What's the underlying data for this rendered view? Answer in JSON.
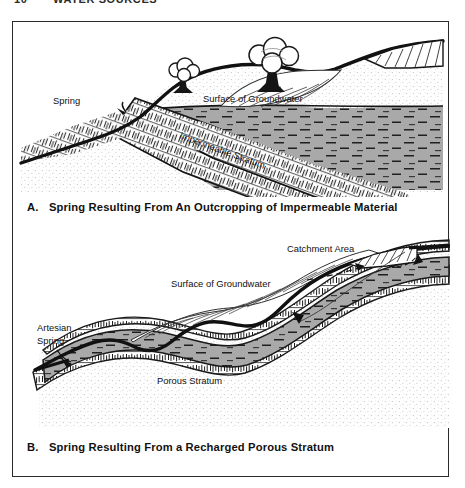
{
  "page_header": {
    "folio": "10",
    "running_head": "WATER SOURCES"
  },
  "figure": {
    "panels": [
      {
        "id": "A",
        "caption_letter": "A.",
        "caption_text": "Spring Resulting From An Outcropping of Impermeable Material",
        "labels": {
          "spring": "Spring",
          "groundwater_surface": "Surface of Groundwater",
          "impermeable_stratum": "Impermeable Stratum"
        }
      },
      {
        "id": "B",
        "caption_letter": "B.",
        "caption_text": "Spring Resulting From a Recharged Porous Stratum",
        "labels": {
          "catchment_area": "Catchment Area",
          "groundwater_surface": "Surface of Groundwater",
          "artesian_spring_line1": "Artesian",
          "artesian_spring_line2": "Spring",
          "porous_stratum": "Porous Stratum"
        }
      }
    ]
  },
  "colors": {
    "ink": "#1a1a1a",
    "frame": "#2a2a2a",
    "aquifer_gray": "#a9a9a9",
    "soil_stipple": "#cfcfcf",
    "paper": "#ffffff"
  }
}
